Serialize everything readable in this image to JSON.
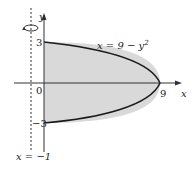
{
  "figure": {
    "curve_label": "x = 9 − y",
    "curve_exp": "2",
    "axis_x_label": "x",
    "axis_y_label": "y",
    "tick_y_top": "3",
    "tick_y_bottom": "−3",
    "tick_origin": "0",
    "tick_x_vertex": "9",
    "line_label": "x = −1",
    "colors": {
      "fill": "#d9d9d9",
      "curve": "#1a1a1a",
      "axis": "#333333"
    }
  }
}
